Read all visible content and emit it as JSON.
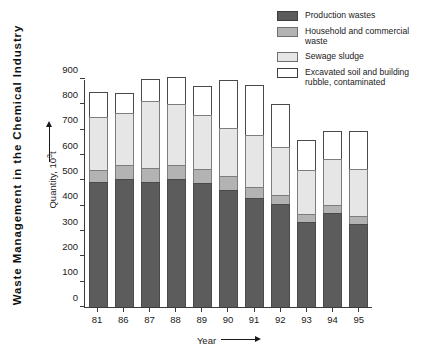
{
  "chart_data": {
    "type": "bar",
    "title": "Waste Management in the Chemical Industry",
    "xlabel": "Year",
    "ylabel": "Quantity, 10³t",
    "ylim": [
      0,
      900
    ],
    "yticks": [
      0,
      100,
      200,
      300,
      400,
      500,
      600,
      700,
      800,
      900
    ],
    "grid": false,
    "stacked": true,
    "legend_position": "top-right",
    "categories": [
      "81",
      "86",
      "87",
      "88",
      "89",
      "90",
      "91",
      "92",
      "93",
      "94",
      "95"
    ],
    "series": [
      {
        "name": "Production wastes",
        "color": "#5c5c5c",
        "values": [
          495,
          505,
          492,
          505,
          488,
          463,
          432,
          405,
          337,
          370,
          328
        ]
      },
      {
        "name": "Household and commercial waste",
        "color": "#b3b3b3",
        "values": [
          47,
          57,
          56,
          57,
          57,
          54,
          43,
          37,
          30,
          31,
          33
        ]
      },
      {
        "name": "Sewage sludge",
        "color": "#e6e6e6",
        "values": [
          208,
          205,
          266,
          240,
          213,
          188,
          203,
          190,
          175,
          183,
          183
        ]
      },
      {
        "name": "Excavated soil and building rubble, contaminated",
        "color": "#ffffff",
        "values": [
          100,
          78,
          85,
          105,
          113,
          193,
          200,
          170,
          118,
          111,
          152
        ]
      }
    ],
    "totals": [
      850,
      845,
      899,
      907,
      871,
      898,
      878,
      802,
      660,
      695,
      696
    ]
  },
  "legend": {
    "items": [
      {
        "label": "Production wastes",
        "swatch": "dark-grey-swatch"
      },
      {
        "label": "Household and commercial waste",
        "swatch": "medium-grey-swatch"
      },
      {
        "label": "Sewage sludge",
        "swatch": "light-grey-swatch"
      },
      {
        "label": "Excavated soil and building rubble, contaminated",
        "swatch": "white-swatch"
      }
    ]
  },
  "axes": {
    "y_unit_base": "Quantity, 10",
    "y_unit_exp": "3",
    "y_unit_tail": "t",
    "x_title": "Year"
  }
}
